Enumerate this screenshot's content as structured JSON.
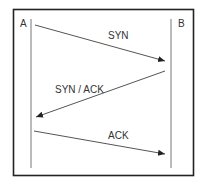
{
  "diagram": {
    "participants": [
      {
        "id": "A",
        "label": "A"
      },
      {
        "id": "B",
        "label": "B"
      }
    ],
    "messages": [
      {
        "from": "A",
        "to": "B",
        "label": "SYN"
      },
      {
        "from": "B",
        "to": "A",
        "label": "SYN / ACK"
      },
      {
        "from": "A",
        "to": "B",
        "label": "ACK"
      }
    ],
    "colors": {
      "border": "#222222",
      "line": "#555555",
      "text": "#333333"
    }
  }
}
